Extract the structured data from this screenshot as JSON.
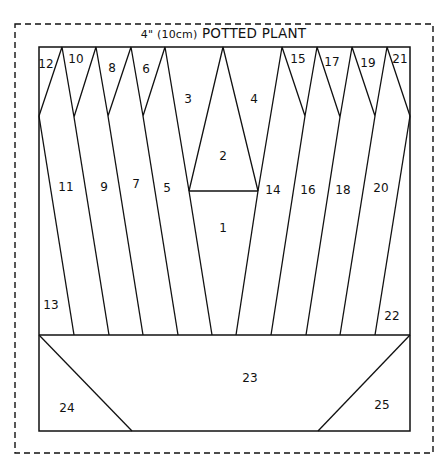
{
  "title": {
    "size_prefix": "4\" (10cm)",
    "name": "POTTED PLANT"
  },
  "colors": {
    "line": "#111111",
    "background": "#ffffff"
  },
  "pieces": [
    {
      "num": "1",
      "x": 223,
      "y": 228
    },
    {
      "num": "2",
      "x": 223,
      "y": 156
    },
    {
      "num": "3",
      "x": 188,
      "y": 99
    },
    {
      "num": "4",
      "x": 254,
      "y": 99
    },
    {
      "num": "5",
      "x": 167,
      "y": 188
    },
    {
      "num": "6",
      "x": 146,
      "y": 69
    },
    {
      "num": "7",
      "x": 136,
      "y": 184
    },
    {
      "num": "8",
      "x": 112,
      "y": 68
    },
    {
      "num": "9",
      "x": 104,
      "y": 187
    },
    {
      "num": "10",
      "x": 76,
      "y": 59
    },
    {
      "num": "11",
      "x": 66,
      "y": 187
    },
    {
      "num": "12",
      "x": 46,
      "y": 64
    },
    {
      "num": "13",
      "x": 51,
      "y": 305
    },
    {
      "num": "14",
      "x": 273,
      "y": 190
    },
    {
      "num": "15",
      "x": 298,
      "y": 59
    },
    {
      "num": "16",
      "x": 308,
      "y": 190
    },
    {
      "num": "17",
      "x": 332,
      "y": 62
    },
    {
      "num": "18",
      "x": 343,
      "y": 190
    },
    {
      "num": "19",
      "x": 368,
      "y": 63
    },
    {
      "num": "20",
      "x": 381,
      "y": 188
    },
    {
      "num": "21",
      "x": 400,
      "y": 59
    },
    {
      "num": "22",
      "x": 392,
      "y": 316
    },
    {
      "num": "23",
      "x": 250,
      "y": 378
    },
    {
      "num": "24",
      "x": 67,
      "y": 408
    },
    {
      "num": "25",
      "x": 382,
      "y": 405
    }
  ]
}
